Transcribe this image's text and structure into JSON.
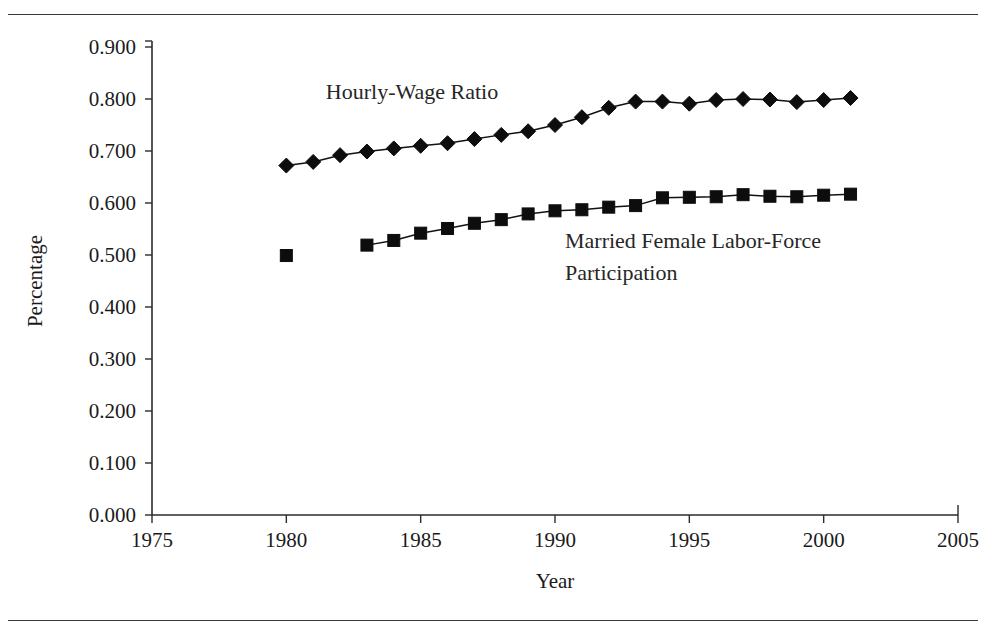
{
  "figure": {
    "has_top_rule": true,
    "has_bottom_rule": true,
    "background_color": "#ffffff",
    "ink_color": "#1a1a1a"
  },
  "chart_data": {
    "type": "line",
    "title": "",
    "xlabel": "Year",
    "ylabel": "Percentage",
    "xlim": [
      1975,
      2005
    ],
    "ylim": [
      0.0,
      0.9
    ],
    "grid": false,
    "legend_position": "inline-annotation",
    "x_ticks": [
      "1975",
      "1980",
      "1985",
      "1990",
      "1995",
      "2000",
      "2005"
    ],
    "x_tick_values": [
      1975,
      1980,
      1985,
      1990,
      1995,
      2000,
      2005
    ],
    "y_ticks": [
      "0.000",
      "0.100",
      "0.200",
      "0.300",
      "0.400",
      "0.500",
      "0.600",
      "0.700",
      "0.800",
      "0.900"
    ],
    "y_tick_values": [
      0.0,
      0.1,
      0.2,
      0.3,
      0.4,
      0.5,
      0.6,
      0.7,
      0.8,
      0.9
    ],
    "series": [
      {
        "name": "Hourly-Wage Ratio",
        "marker": "diamond",
        "color": "#0d0d0d",
        "annotation": "Hourly-Wage Ratio",
        "x": [
          1980,
          1981,
          1982,
          1983,
          1984,
          1985,
          1986,
          1987,
          1988,
          1989,
          1990,
          1991,
          1992,
          1993,
          1994,
          1995,
          1996,
          1997,
          1998,
          1999,
          2000,
          2001
        ],
        "values": [
          0.672,
          0.679,
          0.692,
          0.699,
          0.705,
          0.71,
          0.715,
          0.723,
          0.731,
          0.738,
          0.75,
          0.765,
          0.783,
          0.795,
          0.795,
          0.791,
          0.798,
          0.8,
          0.799,
          0.794,
          0.798,
          0.802
        ]
      },
      {
        "name": "Married Female Labor-Force Participation",
        "marker": "square",
        "color": "#0d0d0d",
        "annotation_line_1": "Married Female Labor-Force",
        "annotation_line_2": "Participation",
        "x": [
          1980,
          1983,
          1984,
          1985,
          1986,
          1987,
          1988,
          1989,
          1990,
          1991,
          1992,
          1993,
          1994,
          1995,
          1996,
          1997,
          1998,
          1999,
          2000,
          2001
        ],
        "values": [
          0.499,
          0.519,
          0.528,
          0.542,
          0.551,
          0.561,
          0.568,
          0.579,
          0.585,
          0.587,
          0.592,
          0.595,
          0.61,
          0.611,
          0.612,
          0.616,
          0.613,
          0.612,
          0.615,
          0.617
        ],
        "gap_after_first_point": true
      }
    ]
  }
}
